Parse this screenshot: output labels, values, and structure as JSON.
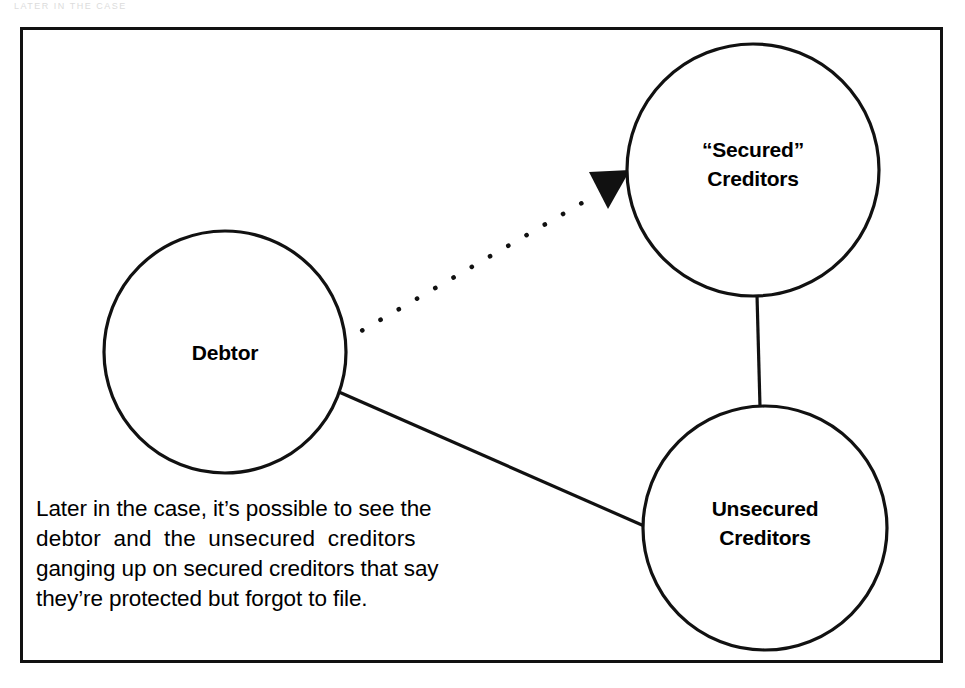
{
  "figure": {
    "top_artifact_text": "LATER IN THE CASE",
    "frame_present": true
  },
  "nodes": [
    {
      "id": "debtor",
      "name": "debtor-node",
      "lines": [
        "Debtor"
      ],
      "cx": 225,
      "cy": 352,
      "r": 121
    },
    {
      "id": "secured",
      "name": "secured-creditors-node",
      "lines": [
        "“Secured”",
        "Creditors"
      ],
      "cx": 753,
      "cy": 170,
      "r": 126
    },
    {
      "id": "unsecured",
      "name": "unsecured-creditors-node",
      "lines": [
        "Unsecured",
        "Creditors"
      ],
      "cx": 765,
      "cy": 528,
      "r": 122
    }
  ],
  "edges": [
    {
      "id": "debtor-to-secured",
      "name": "edge-debtor-to-secured",
      "style": "dotted",
      "arrow": "to-secured",
      "from": "debtor",
      "to": "secured"
    },
    {
      "id": "secured-to-unsecured",
      "name": "edge-secured-to-unsecured",
      "style": "solid",
      "arrow": "none",
      "from": "secured",
      "to": "unsecured"
    },
    {
      "id": "debtor-to-unsecured",
      "name": "edge-debtor-to-unsecured",
      "style": "solid",
      "arrow": "none",
      "from": "debtor",
      "to": "unsecured"
    }
  ],
  "caption": {
    "full_text": "Later in the case, it’s possible to see the debtor and the unsecured creditors ganging up on secured creditors that say they’re protected but forgot to file.",
    "lines": [
      "Later in the case, it’s possible to see the",
      "debtor  and  the  unsecured  creditors",
      "ganging up on secured creditors that say",
      "they’re protected but forgot to file."
    ]
  },
  "colors": {
    "ink": "#111111",
    "text": "#000000",
    "page": "#ffffff"
  }
}
